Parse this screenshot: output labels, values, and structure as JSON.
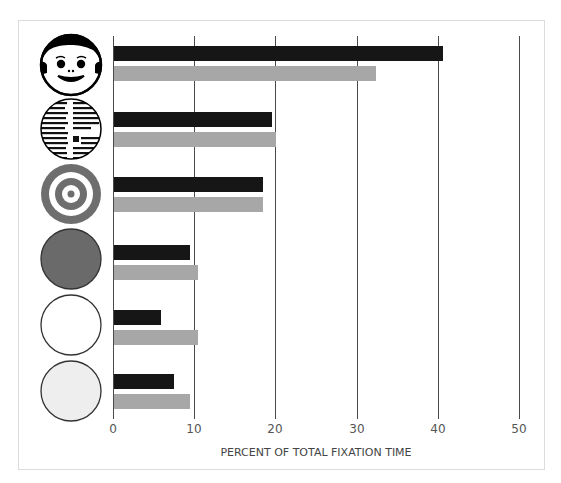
{
  "chart_data": {
    "type": "bar",
    "orientation": "horizontal",
    "title": "",
    "xlabel": "PERCENT OF TOTAL FIXATION TIME",
    "ylabel": "",
    "xlim": [
      0,
      50
    ],
    "xticks": [
      0,
      10,
      20,
      30,
      40,
      50
    ],
    "grid": true,
    "legend": null,
    "categories": [
      "face",
      "printed-text",
      "bullseye-target",
      "dark-gray-disk",
      "white-disk",
      "light-gray-disk"
    ],
    "series": [
      {
        "name": "black",
        "color": "#161616",
        "values": [
          40.5,
          19.4,
          18.3,
          9.3,
          5.8,
          7.4
        ]
      },
      {
        "name": "gray",
        "color": "#a7a7a7",
        "values": [
          32.3,
          20.0,
          18.4,
          10.4,
          10.4,
          9.3
        ]
      }
    ]
  },
  "axis": {
    "ticks": [
      "0",
      "10",
      "20",
      "30",
      "40",
      "50"
    ],
    "title": "PERCENT OF TOTAL FIXATION TIME"
  },
  "colors": {
    "black_bar": "#161616",
    "gray_bar": "#a7a7a7",
    "gridline": "#4a4a4a",
    "target_ring": "#6e6e6e",
    "dark_disk": "#6a6a6a",
    "light_disk": "#eeeeee"
  },
  "icons": [
    "face-icon",
    "printed-text-icon",
    "bullseye-icon",
    "dark-gray-disk-icon",
    "white-disk-icon",
    "light-gray-disk-icon"
  ]
}
